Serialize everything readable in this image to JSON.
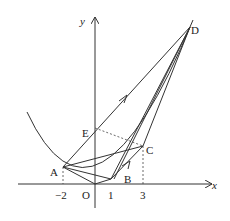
{
  "diagram": {
    "axes": {
      "x_label": "x",
      "y_label": "y",
      "origin_label": "O"
    },
    "ticks": {
      "x": [
        "−2",
        "1",
        "3"
      ]
    },
    "points": {
      "A": {
        "label": "A",
        "coords": [
          -2,
          4
        ]
      },
      "B": {
        "label": "B",
        "coords": [
          1,
          1
        ]
      },
      "C": {
        "label": "C",
        "coords": [
          3,
          9
        ]
      },
      "D": {
        "label": "D"
      },
      "E": {
        "label": "E"
      },
      "O": {
        "label": "O",
        "coords": [
          0,
          0
        ]
      }
    },
    "curve": "y = x^2 (parabola)",
    "colors": {
      "stroke": "#333333",
      "background": "#ffffff"
    }
  }
}
